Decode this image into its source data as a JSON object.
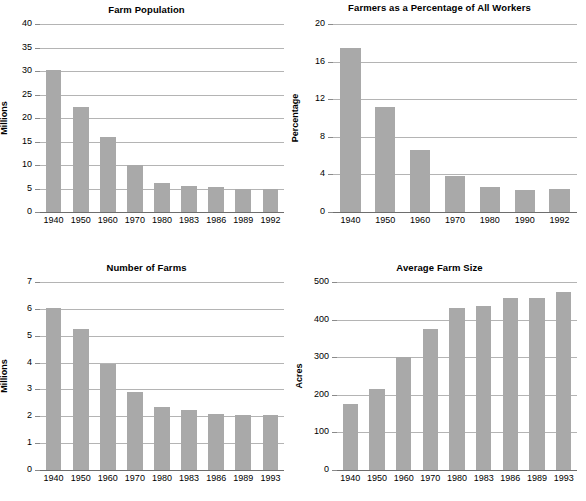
{
  "page": {
    "bar_color": "#a9a9a9",
    "gridline_color": "#b4b4b4",
    "axis_color": "#6e6e6e",
    "text_color": "#000000",
    "background_color": "#ffffff"
  },
  "chart_data": [
    {
      "id": "farm-population",
      "type": "bar",
      "title": "Farm Population",
      "xlabel": "",
      "ylabel": "Millions",
      "categories": [
        "1940",
        "1950",
        "1960",
        "1970",
        "1980",
        "1983",
        "1986",
        "1989",
        "1992"
      ],
      "values": [
        30.2,
        22.4,
        15.9,
        10.0,
        6.2,
        5.5,
        5.4,
        5.0,
        4.8
      ],
      "ylim": [
        0,
        40
      ],
      "ytick_step": 5,
      "yticks": [
        0,
        5,
        10,
        15,
        20,
        25,
        30,
        35,
        40
      ],
      "ytick_labels": [
        "0",
        "5",
        "10",
        "15",
        "20",
        "25",
        "30",
        "35",
        "40"
      ],
      "grid": true,
      "legend": false
    },
    {
      "id": "farmers-percentage-of-all-workers",
      "type": "bar",
      "title": "Farmers as a Percentage of All Workers",
      "xlabel": "",
      "ylabel": "Percentage",
      "categories": [
        "1940",
        "1950",
        "1960",
        "1970",
        "1980",
        "1990",
        "1992"
      ],
      "values": [
        17.4,
        11.2,
        6.6,
        3.85,
        2.7,
        2.35,
        2.5
      ],
      "ylim": [
        0,
        20
      ],
      "ytick_step": 4,
      "yticks": [
        0,
        4,
        8,
        12,
        16,
        20
      ],
      "ytick_labels": [
        "0",
        "4",
        "8",
        "12",
        "16",
        "20"
      ],
      "grid": true,
      "legend": false
    },
    {
      "id": "number-of-farms",
      "type": "bar",
      "title": "Number of Farms",
      "xlabel": "",
      "ylabel": "Millions",
      "categories": [
        "1940",
        "1950",
        "1960",
        "1970",
        "1980",
        "1983",
        "1986",
        "1989",
        "1993"
      ],
      "values": [
        6.05,
        5.25,
        3.95,
        2.9,
        2.35,
        2.25,
        2.1,
        2.05,
        2.05
      ],
      "ylim": [
        0,
        7
      ],
      "ytick_step": 1,
      "yticks": [
        0,
        1,
        2,
        3,
        4,
        5,
        6,
        7
      ],
      "ytick_labels": [
        "0",
        "1",
        "2",
        "3",
        "4",
        "5",
        "6",
        "7"
      ],
      "grid": true,
      "legend": false
    },
    {
      "id": "average-farm-size",
      "type": "bar",
      "title": "Average Farm Size",
      "xlabel": "",
      "ylabel": "Acres",
      "categories": [
        "1940",
        "1950",
        "1960",
        "1970",
        "1980",
        "1983",
        "1986",
        "1989",
        "1993"
      ],
      "values": [
        175,
        215,
        300,
        375,
        430,
        437,
        458,
        458,
        473
      ],
      "ylim": [
        0,
        500
      ],
      "ytick_step": 100,
      "yticks": [
        0,
        100,
        200,
        300,
        400,
        500
      ],
      "ytick_labels": [
        "0",
        "100",
        "200",
        "300",
        "400",
        "500"
      ],
      "grid": true,
      "legend": false
    }
  ],
  "layout": {
    "panels": [
      {
        "chart_index": 0,
        "title_top": 4,
        "plot_left": 40,
        "plot_top": 24,
        "plot_width": 244,
        "plot_height": 188,
        "ylabel_center_y": 118,
        "ylabel_left": 4
      },
      {
        "chart_index": 1,
        "title_top": 2,
        "plot_left": 40,
        "plot_top": 24,
        "plot_width": 244,
        "plot_height": 188,
        "ylabel_center_y": 118,
        "ylabel_left": 2
      },
      {
        "chart_index": 2,
        "title_top": 12,
        "plot_left": 40,
        "plot_top": 32,
        "plot_width": 244,
        "plot_height": 188,
        "ylabel_center_y": 126,
        "ylabel_left": 4
      },
      {
        "chart_index": 3,
        "title_top": 12,
        "plot_left": 44,
        "plot_top": 32,
        "plot_width": 240,
        "plot_height": 188,
        "ylabel_center_y": 126,
        "ylabel_left": 6
      }
    ]
  }
}
